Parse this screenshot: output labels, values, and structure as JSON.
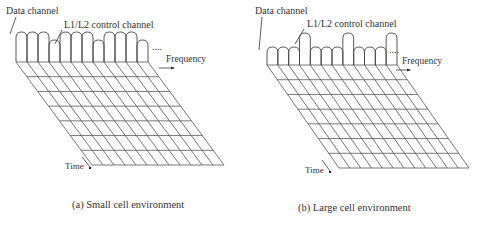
{
  "panels": [
    {
      "id": "a",
      "caption": "(a) Small cell environment",
      "data_channel_label": "Data channel",
      "control_channel_label": "L1/L2 control channel",
      "frequency_label": "Frequency",
      "time_label": "Time",
      "ellipsis": "....",
      "columns": 12,
      "rows": 7,
      "arch_heights": [
        "tall",
        "tall",
        "tall",
        "short",
        "tall",
        "tall",
        "tall",
        "short",
        "tall",
        "tall",
        "tall",
        "short"
      ]
    },
    {
      "id": "b",
      "caption": "(b) Large cell environment",
      "data_channel_label": "Data channel",
      "control_channel_label": "L1/L2 control channel",
      "frequency_label": "Frequency",
      "time_label": "Time",
      "ellipsis": "....",
      "columns": 12,
      "rows": 7,
      "arch_heights": [
        "short",
        "short",
        "short",
        "tall",
        "short",
        "short",
        "short",
        "tall",
        "short",
        "short",
        "short",
        "tall"
      ]
    }
  ]
}
